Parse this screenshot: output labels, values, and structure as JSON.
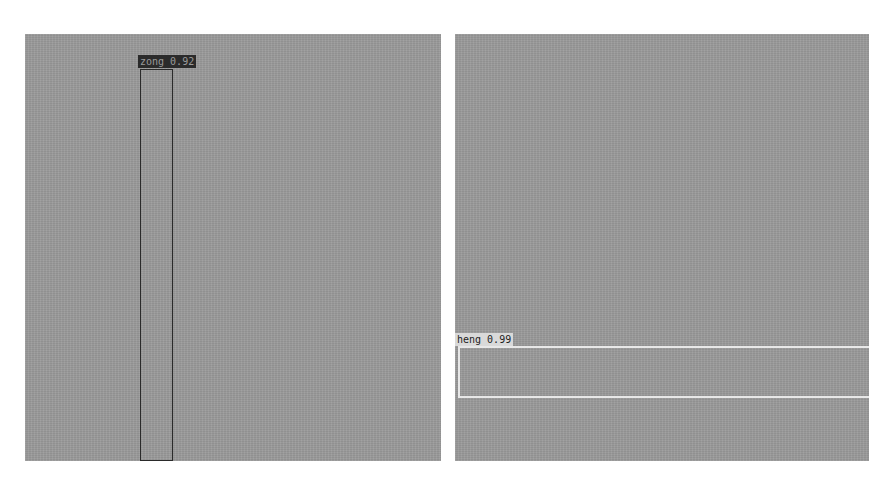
{
  "panels": [
    {
      "id": "left",
      "detections": [
        {
          "label": "zong 0.92",
          "class": "zong",
          "score": 0.92,
          "box_color": "#2a2a2a",
          "label_bg": "#2b2b2b"
        }
      ]
    },
    {
      "id": "right",
      "detections": [
        {
          "label": "heng 0.99",
          "class": "heng",
          "score": 0.99,
          "box_color": "#e8e8e8",
          "label_bg": "#d9d9d9"
        }
      ]
    }
  ]
}
